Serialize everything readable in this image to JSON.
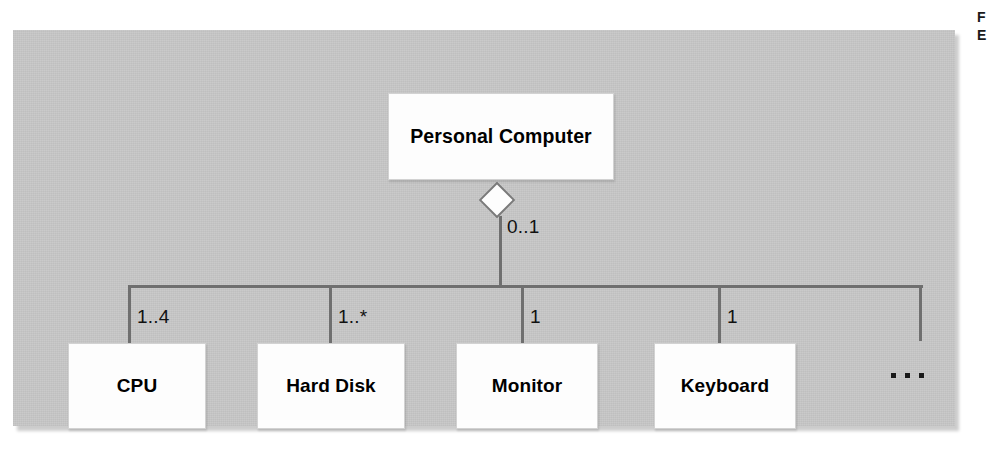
{
  "figure": {
    "type": "uml-class-diagram",
    "relationship": "aggregation",
    "panel_background": "#c8c8c8",
    "line_color": "#6f6f6f",
    "box_fill": "#fdfdfd"
  },
  "whole": {
    "name": "Personal Computer",
    "multiplicity": "0..1",
    "diamond": "hollow-aggregation-diamond"
  },
  "parts": [
    {
      "name": "CPU",
      "multiplicity": "1..4"
    },
    {
      "name": "Hard Disk",
      "multiplicity": "1..*"
    },
    {
      "name": "Monitor",
      "multiplicity": "1"
    },
    {
      "name": "Keyboard",
      "multiplicity": "1"
    }
  ],
  "more": {
    "ellipsis": "...",
    "stub_line": true
  },
  "caption_fragment": {
    "line1": "F",
    "line2": "E"
  }
}
